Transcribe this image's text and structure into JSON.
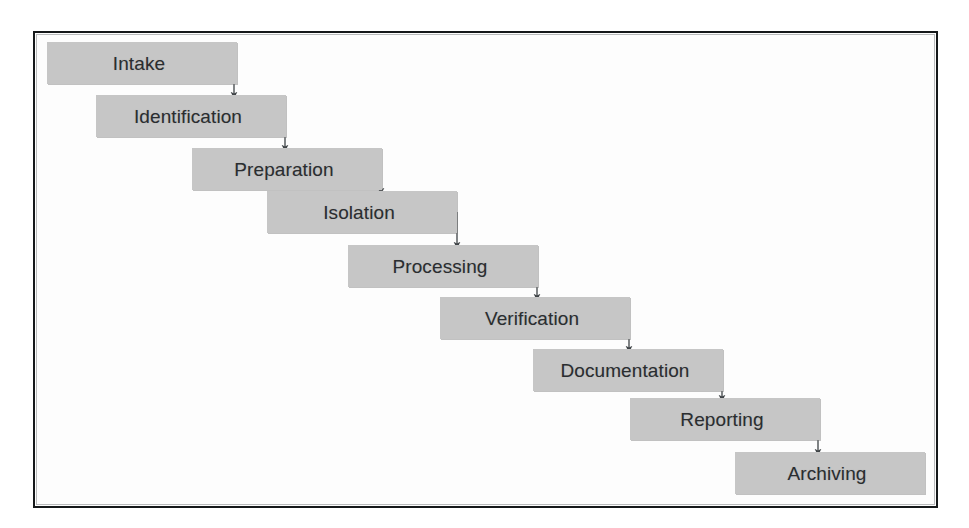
{
  "diagram": {
    "type": "waterfall-cascade-flowchart",
    "orientation": "top-left to bottom-right",
    "frame": {
      "border_color": "#15181a",
      "background": "#fdfdfd",
      "x": 33,
      "y": 31,
      "width": 905,
      "height": 477
    },
    "style": {
      "box_fill": "#c6c6c6",
      "box_text_color": "#2a2d30",
      "connector_color": "#4a4f52",
      "box_width": 190,
      "box_height": 42,
      "step_offset_x": 49,
      "step_offset_y": 53
    },
    "stages": [
      {
        "index": 1,
        "label": "Intake",
        "x": 47,
        "y": 42
      },
      {
        "index": 2,
        "label": "Identification",
        "x": 96,
        "y": 95
      },
      {
        "index": 3,
        "label": "Preparation",
        "x": 192,
        "y": 148
      },
      {
        "index": 4,
        "label": "Isolation",
        "x": 267,
        "y": 191
      },
      {
        "index": 5,
        "label": "Processing",
        "x": 348,
        "y": 245
      },
      {
        "index": 6,
        "label": "Verification",
        "x": 440,
        "y": 297
      },
      {
        "index": 7,
        "label": "Documentation",
        "x": 533,
        "y": 349
      },
      {
        "index": 8,
        "label": "Reporting",
        "x": 630,
        "y": 398
      },
      {
        "index": 9,
        "label": "Archiving",
        "x": 735,
        "y": 452
      }
    ],
    "connectors": [
      {
        "from": "Intake",
        "to": "Identification",
        "x": 234,
        "y1": 63,
        "y2": 95
      },
      {
        "from": "Identification",
        "to": "Preparation",
        "x": 285,
        "y1": 116,
        "y2": 148
      },
      {
        "from": "Preparation",
        "to": "Isolation",
        "x": 381,
        "y1": 169,
        "y2": 191
      },
      {
        "from": "Isolation",
        "to": "Processing",
        "x": 457,
        "y1": 212,
        "y2": 245
      },
      {
        "from": "Processing",
        "to": "Verification",
        "x": 537,
        "y1": 266,
        "y2": 297
      },
      {
        "from": "Verification",
        "to": "Documentation",
        "x": 629,
        "y1": 318,
        "y2": 349
      },
      {
        "from": "Documentation",
        "to": "Reporting",
        "x": 722,
        "y1": 370,
        "y2": 398
      },
      {
        "from": "Reporting",
        "to": "Archiving",
        "x": 818,
        "y1": 419,
        "y2": 452
      }
    ]
  }
}
